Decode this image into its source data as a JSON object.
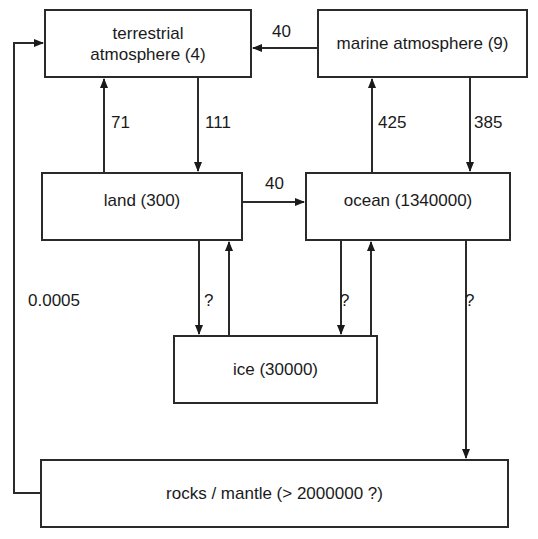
{
  "nodes": {
    "terrestrial_atmosphere": {
      "line1": "terrestrial",
      "line2": "atmosphere (4)"
    },
    "marine_atmosphere": {
      "label": "marine atmosphere (9)"
    },
    "land": {
      "label": "land (300)"
    },
    "ocean": {
      "label": "ocean (1340000)"
    },
    "ice": {
      "label": "ice (30000)"
    },
    "rocks_mantle": {
      "label": "rocks / mantle (> 2000000 ?)"
    }
  },
  "flows": {
    "marine_to_terrestrial": "40",
    "land_to_terrestrial": "71",
    "terrestrial_to_land": "111",
    "ocean_to_marine": "425",
    "marine_to_ocean": "385",
    "land_to_ocean": "40",
    "land_ice": "?",
    "ocean_ice": "?",
    "ocean_to_rocks": "?",
    "rocks_to_terrestrial": "0.0005"
  }
}
